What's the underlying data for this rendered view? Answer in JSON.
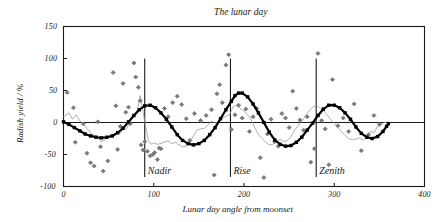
{
  "chart_data": {
    "type": "scatter",
    "title": "The lunar day",
    "xlabel": "Lunar day angle from moonset",
    "ylabel": "Radish yield / %",
    "xlim": [
      0,
      400
    ],
    "ylim": [
      -100,
      150
    ],
    "xticks": [
      0,
      100,
      200,
      300,
      400
    ],
    "xtick_labels": [
      "0",
      "100",
      "200",
      "300",
      "400"
    ],
    "yticks": [
      -100,
      -50,
      0,
      50,
      100,
      150
    ],
    "ytick_labels": [
      "-100",
      "-50",
      "0",
      "50",
      "100",
      "150"
    ],
    "grid": false,
    "legend": "none",
    "zero_line": 0,
    "annotations": [
      {
        "label": "Nadir",
        "x": 90,
        "y_top": 100,
        "y_bottom": -85
      },
      {
        "label": "Rise",
        "x": 185,
        "y_top": 100,
        "y_bottom": -85
      },
      {
        "label": "Zenith",
        "x": 280,
        "y_top": 100,
        "y_bottom": -85
      }
    ],
    "series": [
      {
        "name": "Observations",
        "type": "scatter",
        "marker": "diamond",
        "color": "#7a7a7a",
        "points": [
          [
            4,
            47
          ],
          [
            11,
            23
          ],
          [
            13,
            -31
          ],
          [
            22,
            -2
          ],
          [
            26,
            -48
          ],
          [
            30,
            -63
          ],
          [
            34,
            -68
          ],
          [
            38,
            1
          ],
          [
            41,
            -38
          ],
          [
            44,
            -76
          ],
          [
            49,
            -60
          ],
          [
            55,
            78
          ],
          [
            58,
            26
          ],
          [
            60,
            -42
          ],
          [
            63,
            -6
          ],
          [
            66,
            61
          ],
          [
            69,
            16
          ],
          [
            72,
            24
          ],
          [
            74,
            -2
          ],
          [
            78,
            93
          ],
          [
            80,
            71
          ],
          [
            83,
            55
          ],
          [
            85,
            34
          ],
          [
            86,
            -35
          ],
          [
            88,
            -43
          ],
          [
            90,
            -30
          ],
          [
            93,
            -45
          ],
          [
            96,
            -52
          ],
          [
            99,
            -50
          ],
          [
            101,
            -47
          ],
          [
            104,
            -58
          ],
          [
            106,
            -40
          ],
          [
            108,
            -41
          ],
          [
            112,
            22
          ],
          [
            116,
            9
          ],
          [
            121,
            31
          ],
          [
            126,
            41
          ],
          [
            131,
            28
          ],
          [
            136,
            6
          ],
          [
            140,
            -28
          ],
          [
            145,
            14
          ],
          [
            152,
            3
          ],
          [
            158,
            11
          ],
          [
            164,
            20
          ],
          [
            167,
            -82
          ],
          [
            170,
            45
          ],
          [
            173,
            59
          ],
          [
            176,
            31
          ],
          [
            180,
            90
          ],
          [
            183,
            106
          ],
          [
            186,
            -11
          ],
          [
            190,
            12
          ],
          [
            194,
            27
          ],
          [
            198,
            7
          ],
          [
            202,
            21
          ],
          [
            206,
            -14
          ],
          [
            210,
            9
          ],
          [
            214,
            22
          ],
          [
            218,
            -55
          ],
          [
            222,
            -86
          ],
          [
            226,
            -18
          ],
          [
            230,
            5
          ],
          [
            234,
            -30
          ],
          [
            238,
            -37
          ],
          [
            242,
            14
          ],
          [
            246,
            7
          ],
          [
            250,
            -8
          ],
          [
            254,
            49
          ],
          [
            258,
            22
          ],
          [
            262,
            4
          ],
          [
            266,
            -12
          ],
          [
            270,
            9
          ],
          [
            274,
            -62
          ],
          [
            278,
            -41
          ],
          [
            282,
            108
          ],
          [
            286,
            3
          ],
          [
            290,
            -10
          ],
          [
            294,
            -66
          ],
          [
            298,
            67
          ],
          [
            304,
            -5
          ],
          [
            310,
            7
          ],
          [
            316,
            -14
          ],
          [
            322,
            29
          ],
          [
            330,
            -44
          ],
          [
            338,
            -19
          ],
          [
            344,
            11
          ],
          [
            350,
            -3
          ]
        ]
      },
      {
        "name": "Raw mean",
        "type": "line",
        "color": "#9a9a9a",
        "width": 0.8,
        "points": [
          [
            0,
            9
          ],
          [
            6,
            15
          ],
          [
            10,
            5
          ],
          [
            14,
            12
          ],
          [
            18,
            3
          ],
          [
            22,
            -3
          ],
          [
            26,
            -9
          ],
          [
            30,
            -16
          ],
          [
            34,
            -20
          ],
          [
            38,
            -23
          ],
          [
            42,
            -30
          ],
          [
            46,
            -27
          ],
          [
            50,
            -22
          ],
          [
            54,
            -22
          ],
          [
            58,
            -17
          ],
          [
            62,
            -18
          ],
          [
            66,
            -11
          ],
          [
            70,
            -9
          ],
          [
            74,
            2
          ],
          [
            78,
            8
          ],
          [
            82,
            21
          ],
          [
            85,
            42
          ],
          [
            88,
            18
          ],
          [
            91,
            -6
          ],
          [
            94,
            -28
          ],
          [
            97,
            -34
          ],
          [
            100,
            -32
          ],
          [
            104,
            -34
          ],
          [
            108,
            -33
          ],
          [
            112,
            -30
          ],
          [
            116,
            -29
          ],
          [
            120,
            -33
          ],
          [
            124,
            -31
          ],
          [
            128,
            -35
          ],
          [
            132,
            -38
          ],
          [
            136,
            -37
          ],
          [
            140,
            -32
          ],
          [
            144,
            -21
          ],
          [
            148,
            -12
          ],
          [
            152,
            -10
          ],
          [
            156,
            -9
          ],
          [
            160,
            -4
          ],
          [
            164,
            2
          ],
          [
            168,
            -1
          ],
          [
            172,
            1
          ],
          [
            176,
            6
          ],
          [
            180,
            10
          ],
          [
            184,
            12
          ],
          [
            188,
            25
          ],
          [
            192,
            27
          ],
          [
            196,
            22
          ],
          [
            200,
            18
          ],
          [
            204,
            12
          ],
          [
            208,
            4
          ],
          [
            212,
            -8
          ],
          [
            216,
            -19
          ],
          [
            220,
            -25
          ],
          [
            224,
            -31
          ],
          [
            228,
            -35
          ],
          [
            232,
            -34
          ],
          [
            236,
            -30
          ],
          [
            240,
            -26
          ],
          [
            244,
            -30
          ],
          [
            248,
            -28
          ],
          [
            252,
            -22
          ],
          [
            256,
            -12
          ],
          [
            260,
            -5
          ],
          [
            264,
            2
          ],
          [
            268,
            10
          ],
          [
            272,
            18
          ],
          [
            276,
            24
          ],
          [
            280,
            27
          ],
          [
            284,
            23
          ],
          [
            288,
            19
          ],
          [
            292,
            12
          ],
          [
            296,
            5
          ],
          [
            300,
            -2
          ],
          [
            304,
            -8
          ],
          [
            308,
            -14
          ],
          [
            312,
            -20
          ],
          [
            316,
            -25
          ],
          [
            320,
            -27
          ],
          [
            324,
            -26
          ],
          [
            328,
            -24
          ],
          [
            332,
            -28
          ],
          [
            336,
            -22
          ],
          [
            340,
            -14
          ],
          [
            344,
            -16
          ],
          [
            348,
            -6
          ],
          [
            352,
            -2
          ],
          [
            356,
            0
          ],
          [
            360,
            1
          ]
        ]
      },
      {
        "name": "Smoothed fit",
        "type": "line-markers",
        "marker": "square",
        "color": "#000000",
        "width": 2.2,
        "points": [
          [
            0,
            1
          ],
          [
            6,
            -3
          ],
          [
            12,
            -8
          ],
          [
            18,
            -13
          ],
          [
            24,
            -18
          ],
          [
            30,
            -21
          ],
          [
            36,
            -23
          ],
          [
            42,
            -24
          ],
          [
            48,
            -23
          ],
          [
            54,
            -21
          ],
          [
            60,
            -16
          ],
          [
            66,
            -9
          ],
          [
            72,
            1
          ],
          [
            78,
            11
          ],
          [
            84,
            20
          ],
          [
            90,
            26
          ],
          [
            96,
            27
          ],
          [
            102,
            23
          ],
          [
            108,
            15
          ],
          [
            114,
            5
          ],
          [
            120,
            -7
          ],
          [
            126,
            -19
          ],
          [
            132,
            -28
          ],
          [
            138,
            -33
          ],
          [
            144,
            -35
          ],
          [
            150,
            -33
          ],
          [
            156,
            -28
          ],
          [
            162,
            -19
          ],
          [
            168,
            -8
          ],
          [
            174,
            6
          ],
          [
            180,
            20
          ],
          [
            186,
            33
          ],
          [
            190,
            42
          ],
          [
            194,
            46
          ],
          [
            198,
            46
          ],
          [
            204,
            40
          ],
          [
            210,
            29
          ],
          [
            216,
            15
          ],
          [
            222,
            0
          ],
          [
            228,
            -15
          ],
          [
            234,
            -27
          ],
          [
            240,
            -34
          ],
          [
            246,
            -37
          ],
          [
            252,
            -36
          ],
          [
            258,
            -31
          ],
          [
            264,
            -23
          ],
          [
            270,
            -12
          ],
          [
            276,
            -1
          ],
          [
            282,
            11
          ],
          [
            288,
            21
          ],
          [
            294,
            27
          ],
          [
            300,
            27
          ],
          [
            306,
            23
          ],
          [
            312,
            15
          ],
          [
            318,
            5
          ],
          [
            324,
            -7
          ],
          [
            330,
            -17
          ],
          [
            336,
            -23
          ],
          [
            342,
            -25
          ],
          [
            348,
            -22
          ],
          [
            354,
            -14
          ],
          [
            358,
            -6
          ],
          [
            360,
            -2
          ]
        ]
      }
    ]
  },
  "axes": {
    "title": "The lunar day",
    "x_title": "Lunar day angle from moonset",
    "y_title": "Radish yield / %"
  }
}
